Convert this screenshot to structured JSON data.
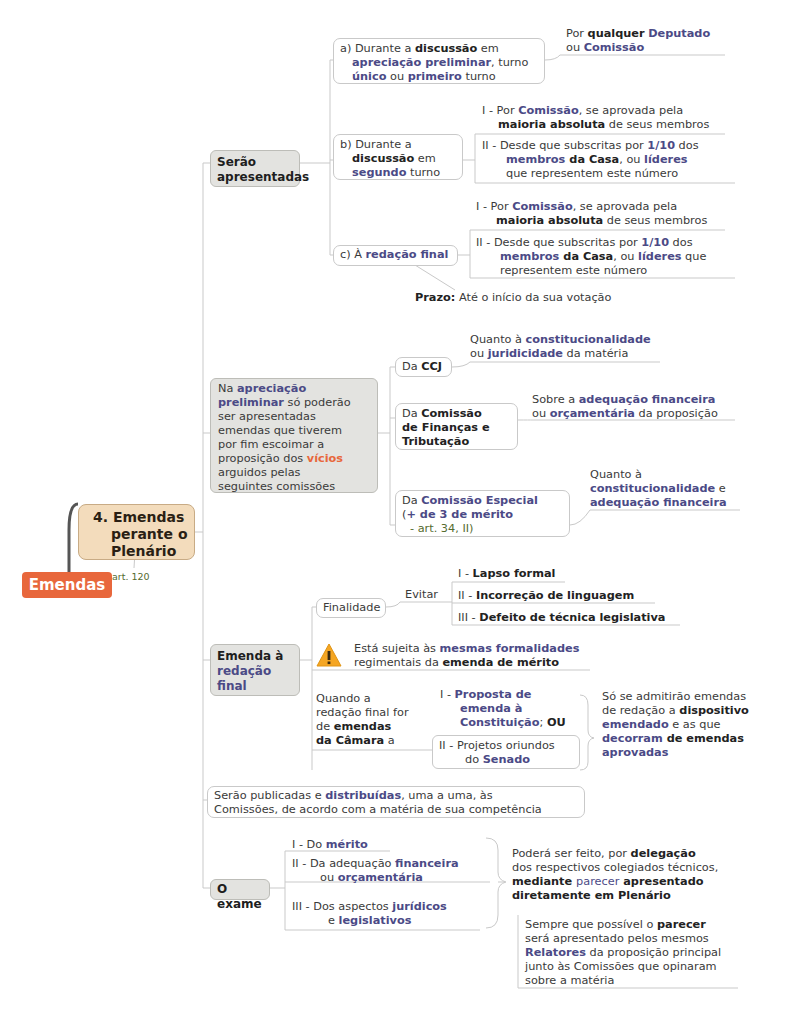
{
  "root": {
    "label": "Emendas",
    "color": "#e8673c"
  },
  "main_topic": {
    "lines": [
      "4. Emendas",
      "perante o",
      "Plenário"
    ],
    "note": "art. 120",
    "color": "#f3dcbc"
  },
  "serao_apresentadas": {
    "label_lines": [
      "Serão",
      "apresentadas"
    ],
    "a": {
      "label": [
        "a) Durante a ",
        "discussão",
        " em",
        "apreciação preliminar",
        ", turno",
        "único",
        " ou ",
        "primeiro",
        " turno"
      ],
      "detail": [
        "Por ",
        "qualquer",
        " ",
        "Deputado",
        "ou ",
        "Comissão"
      ]
    },
    "b": {
      "label": [
        "b) Durante a",
        "discussão",
        " em",
        "segundo",
        " turno"
      ],
      "items": [
        [
          "I - Por ",
          "Comissão",
          ", se aprovada pela",
          "maioria absoluta",
          " de seus membros"
        ],
        [
          "II - Desde que subscritas por ",
          "1/10",
          " dos",
          "membros",
          " da Casa",
          ", ou ",
          "líderes",
          "que representem este número"
        ]
      ]
    },
    "c": {
      "label": [
        "c) À ",
        "redação final"
      ],
      "items": [
        [
          "I - Por ",
          "Comissão",
          ", se aprovada pela",
          "maioria absoluta",
          " de seus membros"
        ],
        [
          "II - Desde que subscritas por ",
          "1/10",
          " dos",
          "membros",
          " da Casa",
          ", ou ",
          "líderes",
          " que",
          "representem este número"
        ]
      ],
      "prazo_label": "Prazo:",
      "prazo_text": " Até o início da sua votação"
    }
  },
  "apreciacao": {
    "lines": [
      "Na ",
      "apreciação",
      "preliminar",
      " só poderão",
      "ser apresentadas",
      "emendas que tiverem",
      "por fim escoimar a",
      "proposição dos ",
      "vícios",
      "arguidos pelas",
      "seguintes comissões"
    ],
    "ccj": {
      "label": [
        "Da ",
        "CCJ"
      ],
      "detail": [
        "Quanto à ",
        "constitucionalidade",
        "ou ",
        "juridicidade",
        " da matéria"
      ]
    },
    "cft": {
      "label": [
        "Da ",
        "Comissão",
        "de Finanças e",
        "Tributação"
      ],
      "detail": [
        "Sobre a ",
        "adequação financeira",
        "ou ",
        "orçamentária",
        " da proposição"
      ]
    },
    "especial": {
      "label": [
        "Da ",
        "Comissão Especial",
        "(",
        "+ de 3 de mérito",
        "- art. 34, II)"
      ],
      "detail": [
        "Quanto à",
        "constitucionalidade",
        " e",
        "adequação financeira"
      ]
    }
  },
  "redacao_final": {
    "label": [
      "Emenda à",
      "redação",
      "final"
    ],
    "finalidade": "Finalidade",
    "evitar": "Evitar",
    "evitar_items": [
      [
        "I - ",
        "Lapso formal"
      ],
      [
        "II - ",
        "Incorreção de linguagem"
      ],
      [
        "III - ",
        "Defeito de técnica legislativa"
      ]
    ],
    "warning_icon": "warning-icon",
    "warning": [
      "Está sujeita às ",
      "mesmas formalidades",
      "regimentais da ",
      "emenda de mérito"
    ],
    "quando": [
      "Quando a",
      "redação final for",
      "de ",
      "emendas",
      "da Câmara",
      " a"
    ],
    "quando_items": [
      [
        "I - ",
        "Proposta de",
        "emenda à",
        "Constituição",
        "; ",
        "OU"
      ],
      [
        "II - Projetos oriundos",
        "do ",
        "Senado"
      ]
    ],
    "quando_result": [
      "Só se admitirão emendas",
      "de redação a ",
      "dispositivo",
      "emendado",
      " e as que",
      "decorram",
      " de emendas",
      "aprovadas"
    ]
  },
  "publicadas": [
    "Serão publicadas e ",
    "distribuídas",
    ", uma a uma, às",
    "Comissões, de acordo com a matéria de sua competência"
  ],
  "exame": {
    "label": "O exame",
    "items": [
      [
        "I - Do ",
        "mérito"
      ],
      [
        "II - Da adequação ",
        "financeira",
        "ou ",
        "orçamentária"
      ],
      [
        "III - Dos aspectos ",
        "jurídicos",
        "e ",
        "legislativos"
      ]
    ],
    "result": [
      "Poderá ser feito, por ",
      "delegação",
      "dos respectivos colegiados técnicos,",
      "mediante ",
      "parecer",
      " apresentado",
      "diretamente em Plenário"
    ],
    "sub_result": [
      "Sempre que possível o ",
      "parecer",
      "será apresentado pelos mesmos",
      "Relatores",
      " da proposição principal",
      "junto às Comissões que opinaram",
      "sobre a matéria"
    ]
  },
  "colors": {
    "accent_purple": "#4b4a86",
    "accent_orange": "#e8673c",
    "node_grey": "#e3e3e0",
    "main_tan": "#f3dcbc",
    "line": "#c9c9c9"
  }
}
